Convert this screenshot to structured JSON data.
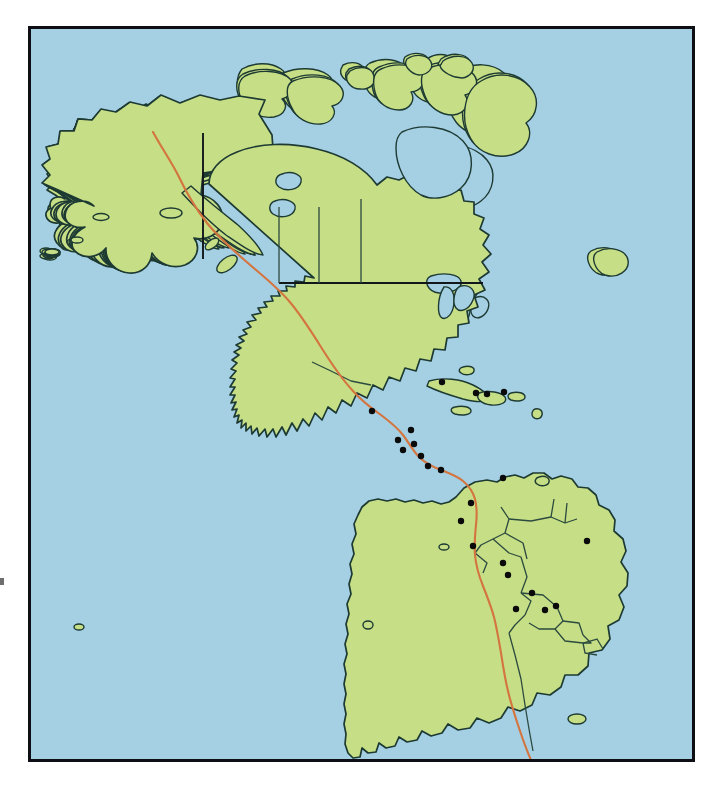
{
  "figure": {
    "kind": "reference-map",
    "title": "Map of the Americas with capital city markers",
    "frame": {
      "border_color": "#0d0f14",
      "border_width_px": 3,
      "left": 28,
      "top": 26,
      "width": 667,
      "height": 736
    }
  },
  "palette": {
    "ocean": "#a5cfe3",
    "land": "#c6de85",
    "land_alt": "#bcd97a",
    "coastline": "#1d3a33",
    "internal_border": "#2c4a3f",
    "route_line": "#d4743f",
    "route_line_dark": "#c05f2c",
    "state_line": "#11171b",
    "city_dot": "#0a0a0a",
    "page_background": "#ffffff"
  },
  "legend_note": {
    "visible": false,
    "text": ""
  },
  "chart_data": {
    "type": "map",
    "title": "Map of the Americas with capital city markers",
    "projection_hint": "generic equal-area style continental outline",
    "grid": false,
    "legend": "none",
    "marker_style": {
      "shape": "circle",
      "radius_px": 3.2,
      "color": "#0a0a0a"
    },
    "markers": [
      {
        "label": "Mexico City",
        "x": 372,
        "y": 411
      },
      {
        "label": "Havana",
        "x": 442,
        "y": 382
      },
      {
        "label": "Guatemala City",
        "x": 398,
        "y": 440
      },
      {
        "label": "Belmopan",
        "x": 411,
        "y": 430
      },
      {
        "label": "San Salvador",
        "x": 403,
        "y": 450
      },
      {
        "label": "Tegucigalpa",
        "x": 414,
        "y": 444
      },
      {
        "label": "Managua",
        "x": 421,
        "y": 456
      },
      {
        "label": "San Jose",
        "x": 428,
        "y": 466
      },
      {
        "label": "Panama City",
        "x": 441,
        "y": 470
      },
      {
        "label": "Port-au-Prince",
        "x": 476,
        "y": 393
      },
      {
        "label": "Santo Domingo",
        "x": 487,
        "y": 394
      },
      {
        "label": "San Juan",
        "x": 504,
        "y": 392
      },
      {
        "label": "Caracas",
        "x": 503,
        "y": 478
      },
      {
        "label": "Bogota",
        "x": 471,
        "y": 503
      },
      {
        "label": "Quito",
        "x": 461,
        "y": 521
      },
      {
        "label": "Lima",
        "x": 473,
        "y": 546
      },
      {
        "label": "La Paz",
        "x": 503,
        "y": 563
      },
      {
        "label": "Sucre",
        "x": 508,
        "y": 575
      },
      {
        "label": "Asuncion",
        "x": 532,
        "y": 593
      },
      {
        "label": "Brasilia",
        "x": 587,
        "y": 541
      },
      {
        "label": "Santiago",
        "x": 516,
        "y": 609
      },
      {
        "label": "Buenos Aires",
        "x": 545,
        "y": 610
      },
      {
        "label": "Montevideo",
        "x": 556,
        "y": 606
      }
    ],
    "regions": [
      "North America",
      "Greenland-free Canadian Arctic Archipelago",
      "United States",
      "Mexico",
      "Central America",
      "Caribbean islands",
      "South America"
    ]
  }
}
